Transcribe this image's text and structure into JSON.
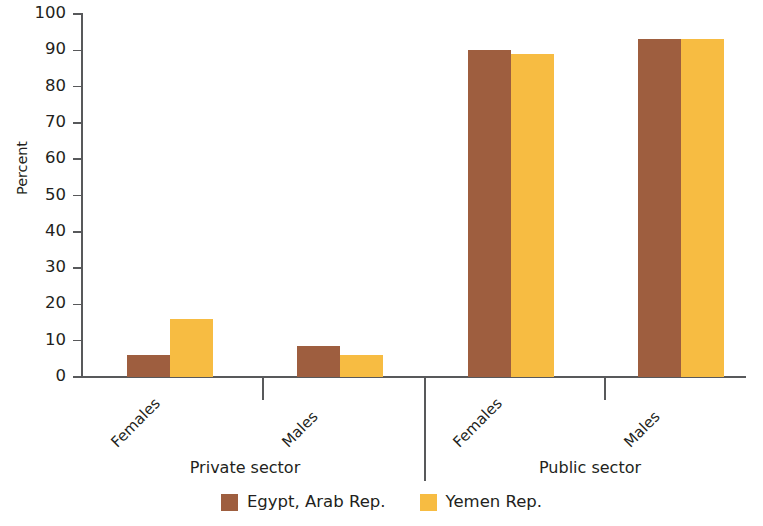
{
  "chart_data": {
    "type": "bar",
    "title": "",
    "subtitle": "",
    "xlabel": "",
    "ylabel": "Percent",
    "ylim": [
      0,
      100
    ],
    "ytick_step": 10,
    "yticks": [
      "100",
      "90",
      "80",
      "70",
      "60",
      "50",
      "40",
      "30",
      "20",
      "10",
      "0"
    ],
    "grid": false,
    "legend_position": "bottom-center",
    "categories": [
      "Females",
      "Males",
      "Females",
      "Males"
    ],
    "groups": [
      {
        "label": "Private sector",
        "categories": [
          "Females",
          "Males"
        ]
      },
      {
        "label": "Public sector",
        "categories": [
          "Females",
          "Males"
        ]
      }
    ],
    "series": [
      {
        "name": "Egypt, Arab Rep.",
        "color": "#9E5E3F",
        "values": [
          6,
          8.5,
          90,
          93
        ]
      },
      {
        "name": "Yemen Rep.",
        "color": "#F7BC42",
        "values": [
          16,
          6,
          89,
          93
        ]
      }
    ],
    "bars": [
      {
        "group": "Private sector",
        "category": "Females",
        "series": "Egypt, Arab Rep.",
        "value": 6
      },
      {
        "group": "Private sector",
        "category": "Females",
        "series": "Yemen Rep.",
        "value": 16
      },
      {
        "group": "Private sector",
        "category": "Males",
        "series": "Egypt, Arab Rep.",
        "value": 8.5
      },
      {
        "group": "Private sector",
        "category": "Males",
        "series": "Yemen Rep.",
        "value": 6
      },
      {
        "group": "Public sector",
        "category": "Females",
        "series": "Egypt, Arab Rep.",
        "value": 90
      },
      {
        "group": "Public sector",
        "category": "Females",
        "series": "Yemen Rep.",
        "value": 89
      },
      {
        "group": "Public sector",
        "category": "Males",
        "series": "Egypt, Arab Rep.",
        "value": 93
      },
      {
        "group": "Public sector",
        "category": "Males",
        "series": "Yemen Rep.",
        "value": 93
      }
    ]
  },
  "legend": {
    "items": [
      {
        "label": "Egypt, Arab Rep.",
        "color": "#9E5E3F"
      },
      {
        "label": "Yemen Rep.",
        "color": "#F7BC42"
      }
    ]
  },
  "axis": {
    "y_title": "Percent",
    "axis_color": "#58595b"
  }
}
